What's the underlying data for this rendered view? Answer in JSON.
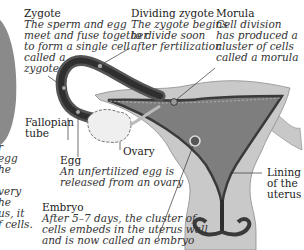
{
  "diagram": {
    "labels": {
      "zygote": {
        "title": "Zygote",
        "lines": [
          "The sperm and egg",
          "meet and fuse together",
          "to form a single cell",
          "called a",
          "zygote"
        ]
      },
      "dividing_zygote": {
        "title": "Dividing zygote",
        "lines": [
          "The zygote begins",
          "to divide soon",
          "after fertilization"
        ]
      },
      "morula": {
        "title": "Morula",
        "lines": [
          "Cell division",
          "has produced a",
          "cluster of cells",
          "called a morula"
        ]
      },
      "fallopian_tube": {
        "lines": [
          "Fallopian",
          "tube"
        ]
      },
      "ovary": {
        "title": "Ovary"
      },
      "egg": {
        "title": "Egg",
        "lines": [
          "An unfertilized egg is",
          "released from an ovary"
        ]
      },
      "lining": {
        "lines": [
          "Lining",
          "of the",
          "uterus"
        ]
      },
      "embryo": {
        "title": "Embryo",
        "lines": [
          "After 5–7 days, the cluster of",
          "cells embeds in the uterus wall",
          "and is now called an embryo"
        ]
      },
      "left_cutoff": {
        "lines": [
          "r",
          "egg",
          "he",
          "",
          "very",
          "he",
          "us, it",
          "f cells."
        ]
      }
    },
    "colors": {
      "tissue_light": "#c9c9c9",
      "tissue_mid": "#9a9a9a",
      "lining_dark": "#3c3c3c",
      "cavity": "#7d7d7d",
      "ovary_fill": "#ededed",
      "leader_line": "#333333"
    }
  }
}
